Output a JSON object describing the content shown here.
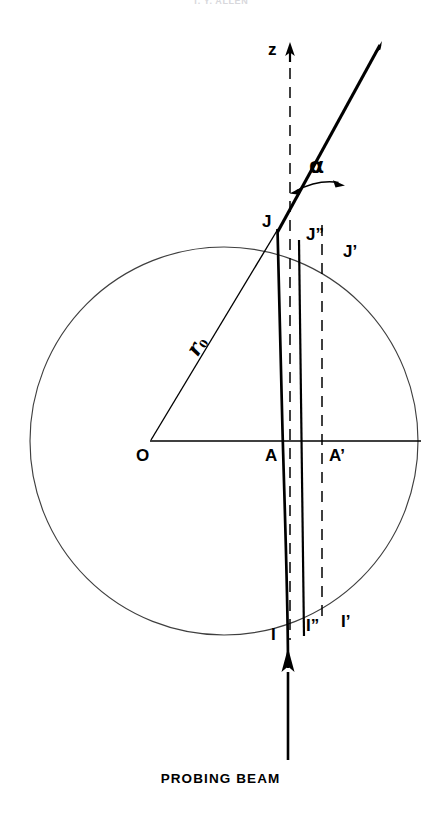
{
  "figure": {
    "header_text": "T. Y. ALLEN",
    "caption": "PROBING BEAM",
    "background_color": "#ffffff",
    "line_color": "#000000",
    "circle_stroke_color": "#3a3a3a"
  },
  "axis": {
    "z_label": "z",
    "z_arrow": "up-arrow-icon"
  },
  "angle": {
    "alpha_label": "α"
  },
  "radius": {
    "label_main": "r",
    "label_sub": "0"
  },
  "points": {
    "origin": "O",
    "j": "J",
    "j_double_prime": "J”",
    "j_prime": "J’",
    "a": "A",
    "a_prime": "A’",
    "i": "I",
    "i_double_prime": "I”",
    "i_prime": "I’"
  },
  "geometry": {
    "circle_center_x": 224,
    "circle_center_y": 441,
    "circle_radius": 194,
    "horizontal_line_y": 441,
    "z_axis_x": 290,
    "alpha_degrees": 13
  }
}
